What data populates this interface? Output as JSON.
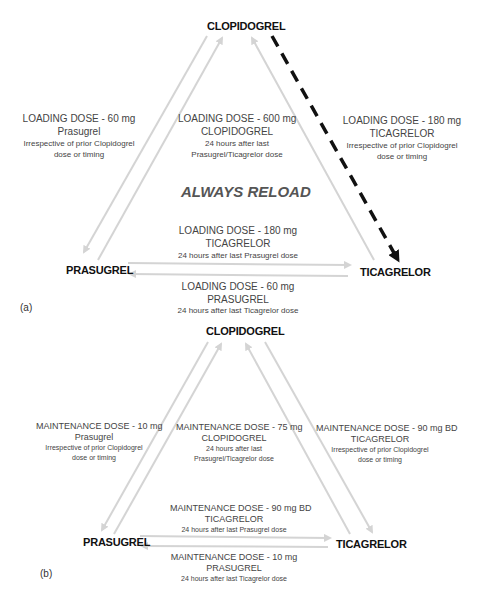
{
  "panel_a": {
    "tag": "(a)",
    "nodes": {
      "top": "CLOPIDOGREL",
      "left": "PRASUGREL",
      "right": "TICAGRELOR"
    },
    "center_text": "ALWAYS RELOAD",
    "labels": {
      "clop_to_pras": {
        "l1": "LOADING DOSE - 60 mg",
        "l2": "Prasugrel",
        "l3": "Irrespective of prior Clopidogrel",
        "l4": "dose or timing"
      },
      "to_clop": {
        "l1": "LOADING DOSE - 600 mg",
        "l2": "CLOPIDOGREL",
        "l3": "24 hours after last",
        "l4": "Prasugrel/Ticagrelor dose"
      },
      "clop_to_tica": {
        "l1": "LOADING DOSE - 180 mg",
        "l2": "TICAGRELOR",
        "l3": "Irrespective of prior Clopidogrel",
        "l4": "dose or timing"
      },
      "pras_to_tica": {
        "l1": "LOADING DOSE - 180 mg",
        "l2": "TICAGRELOR",
        "l3": "24 hours after last Prasugrel dose"
      },
      "tica_to_pras": {
        "l1": "LOADING DOSE - 60 mg",
        "l2": "PRASUGREL",
        "l3": "24 hours after last Ticagrelor dose"
      }
    },
    "arrow_colors": {
      "solid": "#d4d4d4",
      "dashed": "#111111"
    }
  },
  "panel_b": {
    "tag": "(b)",
    "nodes": {
      "top": "CLOPIDOGREL",
      "left": "PRASUGREL",
      "right": "TICAGRELOR"
    },
    "labels": {
      "clop_to_pras": {
        "l1": "MAINTENANCE DOSE - 10 mg",
        "l2": "Prasugrel",
        "l3": "Irrespective of prior Clopidogrel",
        "l4": "dose or timing"
      },
      "to_clop": {
        "l1": "MAINTENANCE DOSE - 75 mg",
        "l2": "CLOPIDOGREL",
        "l3": "24 hours after last",
        "l4": "Prasugrel/Ticagrelor dose"
      },
      "clop_to_tica": {
        "l1": "MAINTENANCE DOSE - 90 mg BD",
        "l2": "TICAGRELOR",
        "l3": "Irrespective of prior Clopidogrel",
        "l4": "dose or timing"
      },
      "pras_to_tica": {
        "l1": "MAINTENANCE DOSE - 90 mg BD",
        "l2": "TICAGRELOR",
        "l3": "24 hours after last Prasugrel dose"
      },
      "tica_to_pras": {
        "l1": "MAINTENANCE DOSE - 10 mg",
        "l2": "PRASUGREL",
        "l3": "24 hours after last Ticagrelor dose"
      }
    },
    "arrow_colors": {
      "solid": "#d4d4d4"
    }
  }
}
